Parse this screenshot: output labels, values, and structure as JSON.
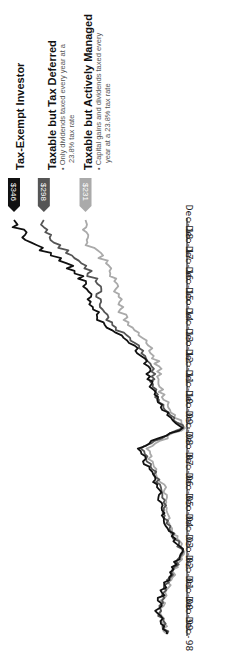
{
  "chart_data": {
    "type": "line",
    "orientation": "rotated-90-clockwise",
    "title": "",
    "xlabel": "",
    "ylabel": "",
    "x": [
      "Dec-98",
      "Dec-99",
      "Dec-00",
      "Dec-01",
      "Dec-02",
      "Dec-03",
      "Dec-04",
      "Dec-05",
      "Dec-06",
      "Dec-07",
      "Dec-08",
      "Dec-09",
      "Dec-10",
      "Dec-11",
      "Dec-12",
      "Dec-13",
      "Dec-14",
      "Dec-15",
      "Dec-16",
      "Dec-17",
      "Dec-18"
    ],
    "ylim": [
      60,
      360
    ],
    "grid": false,
    "series": [
      {
        "name": "Tax-Exempt Investor",
        "color": "#111111",
        "end_label": "$346",
        "values": [
          100,
          115,
          108,
          95,
          75,
          97,
          108,
          112,
          128,
          147,
          75,
          110,
          128,
          130,
          152,
          200,
          225,
          230,
          262,
          318,
          346
        ]
      },
      {
        "name": "Taxable but Tax Deferred",
        "color": "#555555",
        "end_label": "$298",
        "values": [
          100,
          113,
          106,
          93,
          74,
          95,
          105,
          109,
          124,
          142,
          74,
          106,
          123,
          125,
          145,
          188,
          208,
          212,
          238,
          282,
          298
        ]
      },
      {
        "name": "Taxable but Actively Managed",
        "color": "#aaaaaa",
        "end_label": "$231",
        "values": [
          100,
          111,
          103,
          90,
          72,
          92,
          101,
          104,
          117,
          133,
          71,
          98,
          112,
          113,
          130,
          163,
          178,
          180,
          198,
          228,
          231
        ]
      }
    ],
    "legend": [
      {
        "title": "Tax-Exempt Investor",
        "note": ""
      },
      {
        "title": "Taxable but Tax Deferred",
        "note_lines": [
          "• Only dividends taxed every year at a",
          "23.8% tax rate"
        ]
      },
      {
        "title": "Taxable but Actively Managed",
        "note_lines": [
          "• Capital gains and dividends taxed every",
          "year at a 23.8% tax rate"
        ]
      }
    ]
  }
}
